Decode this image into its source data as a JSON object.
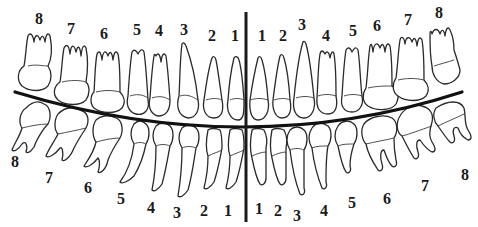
{
  "diagram": {
    "colors": {
      "ink": "#1a1a1a",
      "background": "#ffffff"
    },
    "upper_left_labels": [
      {
        "text": "8",
        "x": 39,
        "y": 19
      },
      {
        "text": "7",
        "x": 71,
        "y": 29
      },
      {
        "text": "6",
        "x": 104,
        "y": 34
      },
      {
        "text": "5",
        "x": 137,
        "y": 30
      },
      {
        "text": "4",
        "x": 159,
        "y": 31
      },
      {
        "text": "3",
        "x": 184,
        "y": 30
      },
      {
        "text": "2",
        "x": 212,
        "y": 36
      },
      {
        "text": "1",
        "x": 235,
        "y": 36
      }
    ],
    "upper_right_labels": [
      {
        "text": "1",
        "x": 262,
        "y": 36
      },
      {
        "text": "2",
        "x": 283,
        "y": 36
      },
      {
        "text": "3",
        "x": 302,
        "y": 25
      },
      {
        "text": "4",
        "x": 326,
        "y": 36
      },
      {
        "text": "5",
        "x": 353,
        "y": 31
      },
      {
        "text": "6",
        "x": 377,
        "y": 26
      },
      {
        "text": "7",
        "x": 408,
        "y": 20
      },
      {
        "text": "8",
        "x": 439,
        "y": 13
      }
    ],
    "lower_left_labels": [
      {
        "text": "8",
        "x": 15,
        "y": 162
      },
      {
        "text": "7",
        "x": 49,
        "y": 178
      },
      {
        "text": "6",
        "x": 88,
        "y": 188
      },
      {
        "text": "5",
        "x": 121,
        "y": 199
      },
      {
        "text": "4",
        "x": 151,
        "y": 208
      },
      {
        "text": "3",
        "x": 177,
        "y": 213
      },
      {
        "text": "2",
        "x": 204,
        "y": 211
      },
      {
        "text": "1",
        "x": 228,
        "y": 211
      }
    ],
    "lower_right_labels": [
      {
        "text": "1",
        "x": 259,
        "y": 209
      },
      {
        "text": "2",
        "x": 278,
        "y": 211
      },
      {
        "text": "3",
        "x": 297,
        "y": 216
      },
      {
        "text": "4",
        "x": 324,
        "y": 211
      },
      {
        "text": "5",
        "x": 352,
        "y": 203
      },
      {
        "text": "6",
        "x": 387,
        "y": 199
      },
      {
        "text": "7",
        "x": 425,
        "y": 186
      },
      {
        "text": "8",
        "x": 465,
        "y": 175
      }
    ]
  }
}
